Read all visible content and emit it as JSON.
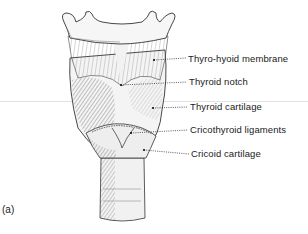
{
  "figure": {
    "panel_label": "(a)",
    "labels": [
      {
        "text": "Thyro-hyoid membrane",
        "x": 188,
        "y": 53,
        "point": [
          154,
          60
        ]
      },
      {
        "text": "Thyroid notch",
        "x": 189,
        "y": 76,
        "point": [
          121,
          85
        ]
      },
      {
        "text": "Thyroid cartilage",
        "x": 190,
        "y": 101,
        "point": [
          153,
          108
        ]
      },
      {
        "text": "Cricothyroid ligaments",
        "x": 190,
        "y": 124,
        "point": [
          131,
          133
        ]
      },
      {
        "text": "Cricoid cartilage",
        "x": 191,
        "y": 148,
        "point": [
          144,
          150
        ]
      }
    ],
    "colors": {
      "ink": "#1a1a1a",
      "shade": "#9a9a9a",
      "light": "#e8e8e8",
      "background": "#ffffff"
    }
  }
}
